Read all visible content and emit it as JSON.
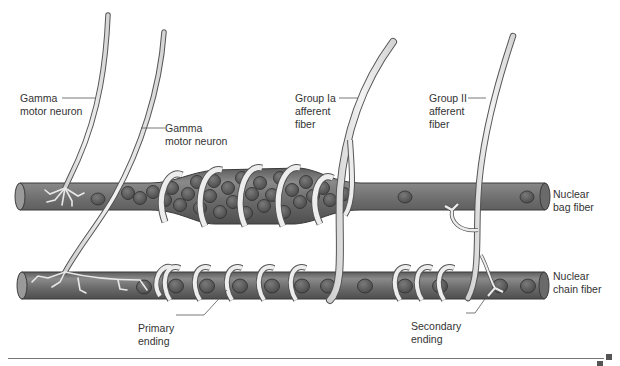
{
  "diagram": {
    "type": "Muscle spindle anatomy",
    "labels": {
      "gamma_motor_neuron_1": "Gamma\nmotor neuron",
      "gamma_motor_neuron_2": "Gamma\nmotor neuron",
      "group_ia_afferent": "Group Ia\nafferent\nfiber",
      "group_ii_afferent": "Group II\nafferent\nfiber",
      "nuclear_bag_fiber": "Nuclear\nbag fiber",
      "nuclear_chain_fiber": "Nuclear\nchain fiber",
      "primary_ending": "Primary\nending",
      "secondary_ending": "Secondary\nending"
    },
    "colors": {
      "fiber_fill": "#6e6e6e",
      "fiber_highlight": "#8a8a8a",
      "nucleus_fill": "#5a5a5a",
      "nerve_fill": "#e6e6e6",
      "nerve_outline": "#555555",
      "label_text": "#333333",
      "leader_line": "#555555"
    }
  }
}
